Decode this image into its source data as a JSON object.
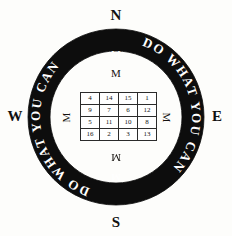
{
  "figure": {
    "background_color": "#fdfdfb",
    "ring_color": "#0d0d0d",
    "ink_color": "#111111"
  },
  "cardinals": {
    "north": "N",
    "east": "E",
    "south": "S",
    "west": "W"
  },
  "ring": {
    "inscription": "DO WHAT YOU CAN",
    "repetitions": 2,
    "direction": "clockwise",
    "full_text": "DO WHAT YOU CAN DO WHAT YOU CAN",
    "text_color": "#ffffff",
    "band_color": "#0d0d0d",
    "marker_glyph": "M",
    "markers": {
      "top": "M",
      "bottom": "M"
    }
  },
  "interior_marks": {
    "north": "M",
    "east": "M",
    "south": "M",
    "west": "M"
  },
  "magic_square": {
    "label": "Jupiter square",
    "size": 4,
    "magic_constant": 34,
    "rows": [
      [
        "4",
        "14",
        "15",
        "1"
      ],
      [
        "9",
        "7",
        "6",
        "12"
      ],
      [
        "5",
        "11",
        "10",
        "8"
      ],
      [
        "16",
        "2",
        "3",
        "13"
      ]
    ]
  }
}
